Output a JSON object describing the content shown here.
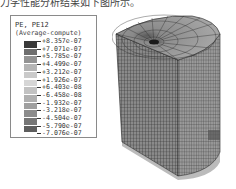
{
  "caption": "力学性能分析结果如下图所示。",
  "legend": {
    "title": "PE, PE12",
    "subtitle": "(Average-compute)",
    "entries": [
      {
        "value": "+8.357e-07",
        "color": "#3a3a3a"
      },
      {
        "value": "+7.071e-07",
        "color": "#6e6e6e"
      },
      {
        "value": "+5.785e-07",
        "color": "#939393"
      },
      {
        "value": "+4.499e-07",
        "color": "#b4b4b4"
      },
      {
        "value": "+3.212e-07",
        "color": "#cacaca"
      },
      {
        "value": "+1.926e-07",
        "color": "#d6d6d6"
      },
      {
        "value": "+6.403e-08",
        "color": "#c2c2c2"
      },
      {
        "value": "-6.458e-08",
        "color": "#b0b0b0"
      },
      {
        "value": "-1.932e-07",
        "color": "#a0a0a0"
      },
      {
        "value": "-3.218e-07",
        "color": "#8c8c8c"
      },
      {
        "value": "-4.504e-07",
        "color": "#767676"
      },
      {
        "value": "-5.790e-07",
        "color": "#5e5e5e"
      },
      {
        "value": "-7.076e-07",
        "color": "#444444"
      }
    ]
  },
  "model": {
    "description": "Quarter-cylinder finite element mesh with refined mesh around central hole at top",
    "mesh_color": "#7a7a7a",
    "line_color": "#2a2a2a"
  }
}
